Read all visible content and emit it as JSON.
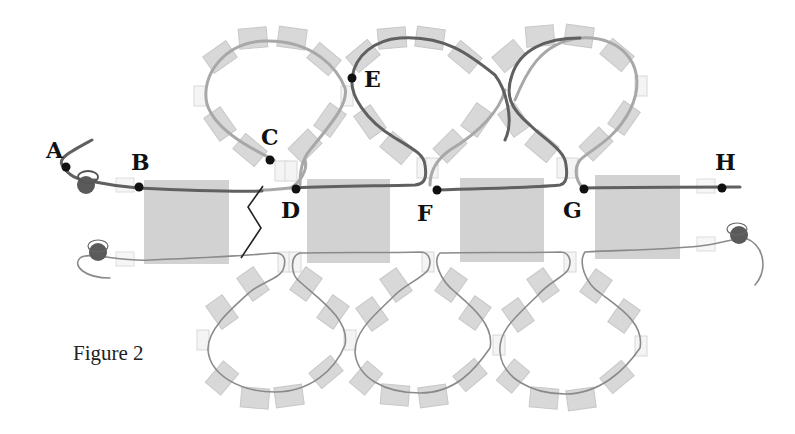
{
  "figure": {
    "caption": "Figure 2",
    "points": [
      {
        "id": "A",
        "label": "A"
      },
      {
        "id": "B",
        "label": "B"
      },
      {
        "id": "C",
        "label": "C"
      },
      {
        "id": "D",
        "label": "D"
      },
      {
        "id": "E",
        "label": "E"
      },
      {
        "id": "F",
        "label": "F"
      },
      {
        "id": "G",
        "label": "G"
      },
      {
        "id": "H",
        "label": "H"
      }
    ],
    "colors": {
      "thread_dark": "#555555",
      "thread_light": "#a8a8a8",
      "bead": "#d6d6d6",
      "square_block": "#d0d0d0",
      "point": "#111111",
      "end_bead": "#5a5a5a"
    }
  }
}
